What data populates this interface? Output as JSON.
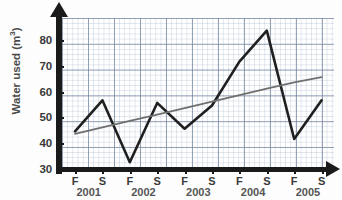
{
  "chart_data": {
    "type": "line",
    "title": "",
    "xlabel": "",
    "ylabel": "Water used (m³)",
    "ylabel_text": "Water used (m",
    "ylabel_sup": "3",
    "ylabel_suffix": ")",
    "grid": true,
    "legend": "none",
    "ylim": [
      30,
      85
    ],
    "yticks": [
      30,
      40,
      50,
      60,
      70,
      80
    ],
    "categories": [
      "F",
      "S",
      "F",
      "S",
      "F",
      "S",
      "F",
      "S",
      "F",
      "S"
    ],
    "year_groups": [
      "2001",
      "2002",
      "2003",
      "2004",
      "2005"
    ],
    "series": [
      {
        "name": "Water used",
        "color": "#1f1f1f",
        "values": [
          45,
          57,
          33,
          56,
          46,
          55,
          72,
          84,
          42,
          57
        ]
      },
      {
        "name": "Trend line",
        "color": "#6f6f6f",
        "type": "trend",
        "values": [
          44,
          46.5,
          49,
          51.5,
          54,
          56.5,
          59,
          61.5,
          64,
          66
        ]
      }
    ]
  }
}
